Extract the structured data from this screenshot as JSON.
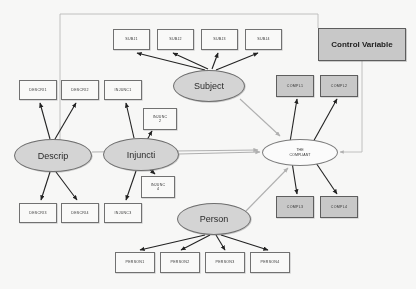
{
  "diagram": {
    "colors": {
      "shaded_fill": "#c9c9c9",
      "latent_fill": "#d6d6d6",
      "plain_fill": "#fdfdfc",
      "stroke": "#6e6e6e",
      "arrow_dark": "#1a1a1a",
      "arrow_light": "#b0b0b0"
    },
    "latents": [
      {
        "id": "descrip",
        "label": "Descrip",
        "x": 14,
        "y": 139,
        "w": 78,
        "h": 33
      },
      {
        "id": "injuncti",
        "label": "Injuncti",
        "x": 103,
        "y": 138,
        "w": 76,
        "h": 33
      },
      {
        "id": "subject",
        "label": "Subject",
        "x": 173,
        "y": 70,
        "w": 72,
        "h": 32
      },
      {
        "id": "person",
        "label": "Person",
        "x": 177,
        "y": 203,
        "w": 74,
        "h": 32
      }
    ],
    "outcome": {
      "id": "compliant",
      "line1": "THE",
      "line2": "COMPLIANT",
      "x": 262,
      "y": 139,
      "w": 76,
      "h": 27
    },
    "control": {
      "id": "control-variable",
      "label": "Control Variable",
      "x": 318,
      "y": 28,
      "w": 88,
      "h": 33
    },
    "indicators": [
      {
        "id": "subj1",
        "label": "SUBJ1",
        "x": 113,
        "y": 29,
        "w": 37,
        "h": 21,
        "shaded": false
      },
      {
        "id": "subj2",
        "label": "SUBJ2",
        "x": 157,
        "y": 29,
        "w": 37,
        "h": 21,
        "shaded": false
      },
      {
        "id": "subj3",
        "label": "SUBJ3",
        "x": 201,
        "y": 29,
        "w": 37,
        "h": 21,
        "shaded": false
      },
      {
        "id": "subj4",
        "label": "SUBJ4",
        "x": 245,
        "y": 29,
        "w": 37,
        "h": 21,
        "shaded": false
      },
      {
        "id": "descri1",
        "label": "DESCRI1",
        "x": 19,
        "y": 80,
        "w": 38,
        "h": 20,
        "shaded": false
      },
      {
        "id": "descri2",
        "label": "DESCRI2",
        "x": 61,
        "y": 80,
        "w": 38,
        "h": 20,
        "shaded": false
      },
      {
        "id": "descri3",
        "label": "DESCRI3",
        "x": 19,
        "y": 203,
        "w": 38,
        "h": 20,
        "shaded": false
      },
      {
        "id": "descri4",
        "label": "DESCRI4",
        "x": 61,
        "y": 203,
        "w": 38,
        "h": 20,
        "shaded": false
      },
      {
        "id": "injunc1",
        "label": "INJUNC1",
        "x": 104,
        "y": 80,
        "w": 38,
        "h": 20,
        "shaded": false
      },
      {
        "id": "injunc3",
        "label": "INJUNC3",
        "x": 104,
        "y": 203,
        "w": 38,
        "h": 20,
        "shaded": false
      },
      {
        "id": "compl1",
        "label": "COMPL1",
        "x": 276,
        "y": 75,
        "w": 38,
        "h": 22,
        "shaded": true
      },
      {
        "id": "compl2",
        "label": "COMPL2",
        "x": 320,
        "y": 75,
        "w": 38,
        "h": 22,
        "shaded": true
      },
      {
        "id": "compl3",
        "label": "COMPL3",
        "x": 276,
        "y": 196,
        "w": 38,
        "h": 22,
        "shaded": true
      },
      {
        "id": "compl4",
        "label": "COMPL4",
        "x": 320,
        "y": 196,
        "w": 38,
        "h": 22,
        "shaded": true
      },
      {
        "id": "person1",
        "label": "PERSON1",
        "x": 115,
        "y": 252,
        "w": 40,
        "h": 21,
        "shaded": false
      },
      {
        "id": "person2",
        "label": "PERSON2",
        "x": 160,
        "y": 252,
        "w": 40,
        "h": 21,
        "shaded": false
      },
      {
        "id": "person3",
        "label": "PERSON3",
        "x": 205,
        "y": 252,
        "w": 40,
        "h": 21,
        "shaded": false
      },
      {
        "id": "person4",
        "label": "PERSON4",
        "x": 250,
        "y": 252,
        "w": 40,
        "h": 21,
        "shaded": false
      }
    ],
    "indicators_two_line": [
      {
        "id": "injunc2",
        "line1": "INJUNC",
        "line2": "2",
        "x": 143,
        "y": 108,
        "w": 34,
        "h": 22,
        "shaded": false
      },
      {
        "id": "injunc4",
        "line1": "INJUNC",
        "line2": "4",
        "x": 141,
        "y": 176,
        "w": 34,
        "h": 22,
        "shaded": false
      }
    ]
  }
}
